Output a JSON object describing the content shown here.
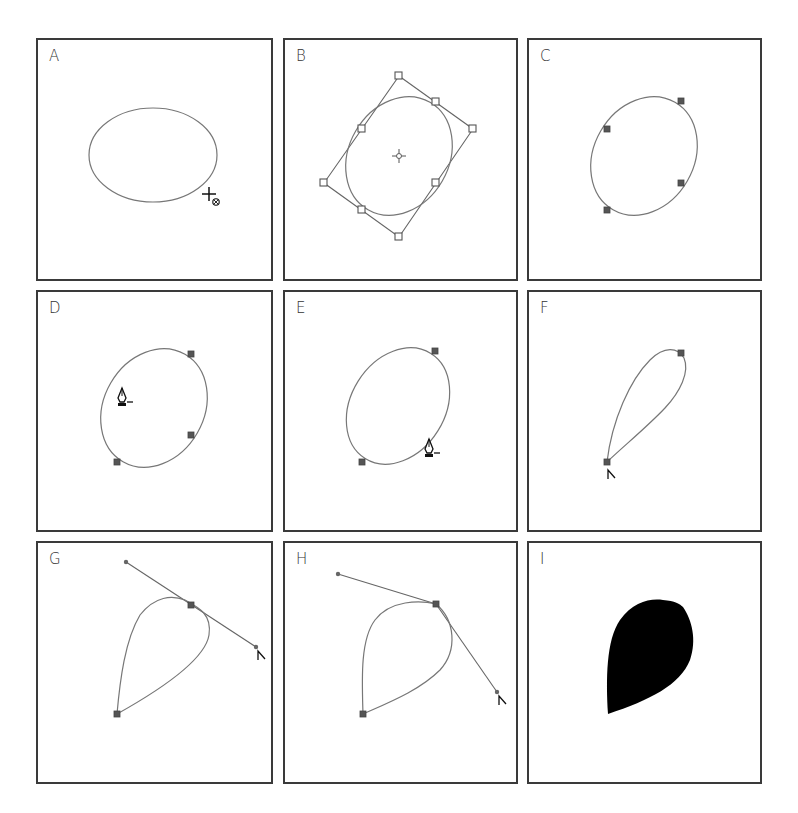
{
  "figure": {
    "panels": [
      {
        "id": "A",
        "label": "A",
        "content": "Ellipse drawn with ellipse tool; crosshair cursor with target symbol at lower right"
      },
      {
        "id": "B",
        "label": "B",
        "content": "Ellipse rotated inside bounding box with 8 hollow square handles and center point"
      },
      {
        "id": "C",
        "label": "C",
        "content": "Rotated ellipse path with 4 selected anchor points"
      },
      {
        "id": "D",
        "label": "D",
        "content": "Delete-anchor pen cursor over upper-left anchor; 3 anchors remain"
      },
      {
        "id": "E",
        "label": "E",
        "content": "Delete-anchor pen cursor over lower-right anchor; 2 anchors remain"
      },
      {
        "id": "F",
        "label": "F",
        "content": "Teardrop path with 2 anchors; convert-point cursor at bottom anchor"
      },
      {
        "id": "G",
        "label": "G",
        "content": "Direction handles dragged from top anchor; convert cursor at handle end"
      },
      {
        "id": "H",
        "label": "H",
        "content": "Handle bent to create corner point on top anchor"
      },
      {
        "id": "I",
        "label": "I",
        "content": "Final filled black leaf shape"
      }
    ]
  },
  "colors": {
    "border": "#3a3a3a",
    "path_stroke": "#777777",
    "anchor_fill": "#555555",
    "fill": "#000000",
    "background": "#ffffff"
  }
}
